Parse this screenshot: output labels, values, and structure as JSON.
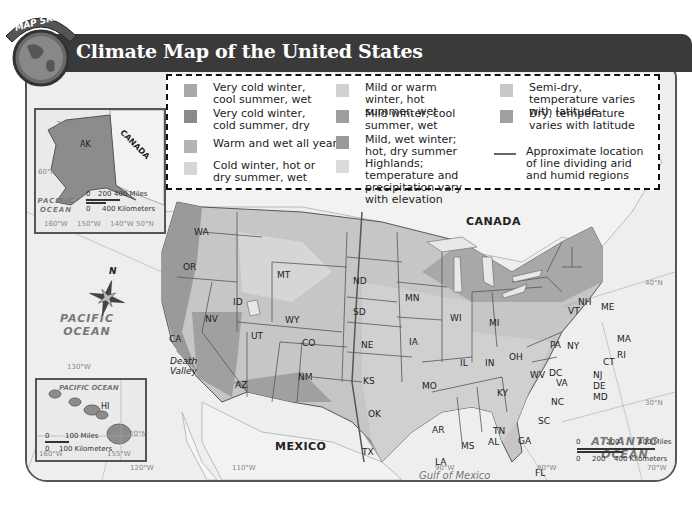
{
  "header": {
    "badge": "MAP SKILL",
    "title": "Climate Map of the United States"
  },
  "legend": {
    "items": [
      {
        "label": "Very cold winter, cool summer, wet",
        "color": "#a8a8a8"
      },
      {
        "label": "Very cold winter, cold summer, dry",
        "color": "#8a8a8a"
      },
      {
        "label": "Warm and wet all year",
        "color": "#b4b4b4"
      },
      {
        "label": "Cold winter, hot or dry summer, wet",
        "color": "#d6d6d6"
      },
      {
        "label": "Mild or warm winter, hot summer, wet",
        "color": "#d0d0d0"
      },
      {
        "label": "Mild winter, cool summer, wet",
        "color": "#9e9e9e"
      },
      {
        "label": "Mild, wet winter; hot, dry summer",
        "color": "#9a9a9a"
      },
      {
        "label": "Highlands; temperature and precipitation vary with elevation",
        "color": "#dcdcdc"
      },
      {
        "label": "Semi-dry, temperature varies with latitude",
        "color": "#c8c8c8"
      },
      {
        "label": "Dry, temperature varies with latitude",
        "color": "#a0a0a0"
      },
      {
        "label": "Approximate location of line dividing arid and humid regions",
        "type": "line",
        "color": "#666666"
      }
    ]
  },
  "alaska_inset": {
    "state": "AK",
    "country": "CANADA",
    "ocean": "PACIFIC OCEAN",
    "lat_labels": [
      "70°N",
      "60°N",
      "50°N"
    ],
    "lon_labels": [
      "160°W",
      "150°W",
      "140°W"
    ],
    "scale_miles": [
      "0",
      "200",
      "400 Miles"
    ],
    "scale_km": [
      "0",
      "400 Kilometers"
    ]
  },
  "hawaii_inset": {
    "state": "HI",
    "ocean": "PACIFIC OCEAN",
    "lat_label": "20°N",
    "lon_labels": [
      "160°W",
      "155°W"
    ],
    "scale_miles": [
      "0",
      "100 Miles"
    ],
    "scale_km": [
      "0",
      "100 Kilometers"
    ]
  },
  "map": {
    "compass": "N",
    "oceans": {
      "pacific": "PACIFIC OCEAN",
      "atlantic": "ATLANTIC OCEAN",
      "gulf": "Gulf of Mexico"
    },
    "countries": {
      "canada": "CANADA",
      "mexico": "MEXICO"
    },
    "features": {
      "death_valley": "Death Valley",
      "superior": "L. Superior",
      "michigan": "L. Michigan",
      "huron": "L. Huron",
      "ontario": "L. Ontario",
      "erie": "L. Erie"
    },
    "states": [
      "WA",
      "OR",
      "CA",
      "ID",
      "NV",
      "MT",
      "WY",
      "UT",
      "AZ",
      "CO",
      "NM",
      "ND",
      "SD",
      "NE",
      "KS",
      "OK",
      "TX",
      "MN",
      "IA",
      "MO",
      "AR",
      "LA",
      "WI",
      "IL",
      "MI",
      "IN",
      "OH",
      "KY",
      "TN",
      "MS",
      "AL",
      "GA",
      "FL",
      "SC",
      "NC",
      "VA",
      "WV",
      "DC",
      "MD",
      "DE",
      "NJ",
      "PA",
      "NY",
      "CT",
      "RI",
      "MA",
      "VT",
      "NH",
      "ME"
    ],
    "lat_labels": [
      "40°N",
      "30°N"
    ],
    "lon_labels": [
      "130°W",
      "120°W",
      "110°W",
      "90°W",
      "80°W",
      "70°W"
    ],
    "scale_miles": [
      "0",
      "200",
      "400 Miles"
    ],
    "scale_km": [
      "0",
      "200",
      "400 Kilometers"
    ]
  }
}
